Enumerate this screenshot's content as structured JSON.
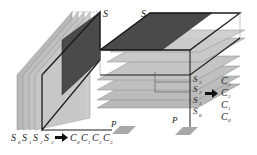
{
  "diagram": {
    "left_figure": {
      "top_label": "S",
      "point_label": "P",
      "slice_labels": [
        {
          "base": "S",
          "sub": "0"
        },
        {
          "base": "S",
          "sub": "1"
        },
        {
          "base": "S",
          "sub": "2"
        },
        {
          "base": "S",
          "sub": "3"
        }
      ],
      "arrow": "➡",
      "result_labels": [
        {
          "base": "C",
          "sub": "0"
        },
        {
          "base": "C",
          "sub": "1"
        },
        {
          "base": "C",
          "sub": "2"
        },
        {
          "base": "C",
          "sub": "3"
        }
      ]
    },
    "right_figure": {
      "top_label": "S",
      "point_label": "P",
      "slice_labels": [
        {
          "base": "S",
          "sub": "3"
        },
        {
          "base": "S",
          "sub": "2"
        },
        {
          "base": "S",
          "sub": "1"
        },
        {
          "base": "S",
          "sub": "0"
        }
      ],
      "arrow": "➡",
      "result_labels": [
        {
          "base": "C",
          "sub": "3"
        },
        {
          "base": "C",
          "sub": "2"
        },
        {
          "base": "C",
          "sub": "1"
        },
        {
          "base": "C",
          "sub": "0"
        }
      ]
    },
    "colors": {
      "dark_slab": "#4a4a4a",
      "light_slab": "#b4b4b4",
      "mid_slab": "#9a9a9a",
      "edge": "#1a1a1a"
    }
  }
}
